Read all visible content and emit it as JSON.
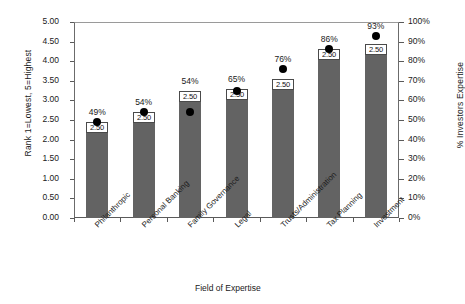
{
  "chart_data": {
    "type": "bar",
    "title": "",
    "xlabel": "Field of Expertise",
    "ylabel": "Rank 1=Lowest, 5=Highest",
    "y2label": "% Investors Expertise",
    "categories": [
      "Philanthropic",
      "Personal Banking",
      "Family Governance",
      "Legal",
      "Trusts/Administration",
      "Tax Planning",
      "Investment"
    ],
    "series": [
      {
        "name": "Rank",
        "type": "bar",
        "axis": "left",
        "values": [
          2.45,
          2.7,
          3.25,
          3.3,
          3.55,
          4.3,
          4.45
        ],
        "data_labels": [
          "2.50",
          "2.50",
          "2.50",
          "2.50",
          "2.50",
          "2.50",
          "2.50"
        ]
      },
      {
        "name": "% Investors Expertise",
        "type": "scatter",
        "axis": "right",
        "values": [
          49,
          54,
          54,
          65,
          76,
          86,
          93
        ],
        "data_labels": [
          "49%",
          "54%",
          "54%",
          "65%",
          "76%",
          "86%",
          "93%"
        ]
      }
    ],
    "ylim": [
      0,
      5
    ],
    "ylim2": [
      0,
      100
    ],
    "yticks": [
      "0.00",
      "0.50",
      "1.00",
      "1.50",
      "2.00",
      "2.50",
      "3.00",
      "3.50",
      "4.00",
      "4.50",
      "5.00"
    ],
    "y2ticks": [
      "0%",
      "10%",
      "20%",
      "30%",
      "40%",
      "50%",
      "60%",
      "70%",
      "80%",
      "90%",
      "100%"
    ],
    "grid": false,
    "legend": "none",
    "bar_color": "#636363",
    "dot_color": "#000000",
    "label_box_color": "#ffffff"
  }
}
